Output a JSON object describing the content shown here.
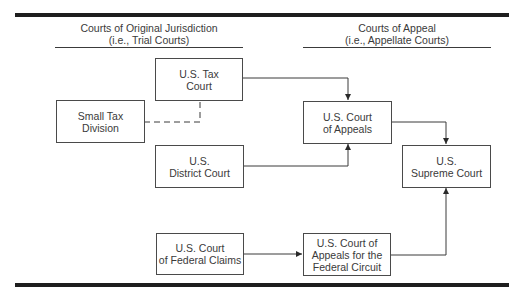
{
  "headers": {
    "left": {
      "line1": "Courts of Original Jurisdiction",
      "line2": "(i.e., Trial Courts)"
    },
    "right": {
      "line1": "Courts of Appeal",
      "line2": "(i.e., Appellate Courts)"
    }
  },
  "nodes": {
    "tax_court": "U.S. Tax\nCourt",
    "small_tax_division": "Small Tax\nDivision",
    "district_court": "U.S.\nDistrict Court",
    "federal_claims": "U.S. Court\nof Federal Claims",
    "court_of_appeals": "U.S. Court\nof Appeals",
    "supreme_court": "U.S.\nSupreme Court",
    "federal_circuit": "U.S. Court of\nAppeals for the\nFederal Circuit"
  },
  "edges": [
    {
      "from": "tax_court",
      "to": "court_of_appeals",
      "style": "solid",
      "arrow": true
    },
    {
      "from": "small_tax_division",
      "to": "tax_court",
      "style": "dashed",
      "arrow": false
    },
    {
      "from": "district_court",
      "to": "court_of_appeals",
      "style": "solid",
      "arrow": true
    },
    {
      "from": "court_of_appeals",
      "to": "supreme_court",
      "style": "solid",
      "arrow": true
    },
    {
      "from": "federal_claims",
      "to": "federal_circuit",
      "style": "solid",
      "arrow": true
    },
    {
      "from": "federal_circuit",
      "to": "supreme_court",
      "style": "solid",
      "arrow": true
    }
  ],
  "colors": {
    "line": "#3a3a3a",
    "bar": "#1e1e1e",
    "background": "#ffffff"
  }
}
